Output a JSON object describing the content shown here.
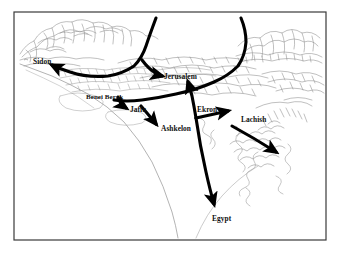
{
  "figure": {
    "type": "pictorial-relief-map",
    "region": "Eastern Mediterranean coast / Levant",
    "background_color": "#ffffff",
    "frame_color": "#3a3a3a",
    "terrain_ink_color": "#8c8c8c",
    "route_color": "#000000",
    "label_color": "#111111"
  },
  "labels": {
    "sidon": "Sidon",
    "benei_berak": "Benei Berak",
    "jaffa": "Jaffa",
    "jerusalem": "Jerusalem",
    "ashkelon": "Ashkelon",
    "ekron": "Ekron",
    "lachish": "Lachish",
    "egypt": "Egypt"
  },
  "map_data": {
    "places": [
      {
        "name": "Sidon",
        "x": 48,
        "y": 62,
        "label_anchor": "start"
      },
      {
        "name": "Benei Berak",
        "x": 89,
        "y": 97,
        "label_anchor": "start"
      },
      {
        "name": "Jaffa",
        "x": 133,
        "y": 110,
        "label_anchor": "start"
      },
      {
        "name": "Jerusalem",
        "x": 164,
        "y": 78,
        "label_anchor": "start"
      },
      {
        "name": "Ashkelon",
        "x": 163,
        "y": 129,
        "label_anchor": "start"
      },
      {
        "name": "Ekron",
        "x": 199,
        "y": 110,
        "label_anchor": "start"
      },
      {
        "name": "Lachish",
        "x": 243,
        "y": 120,
        "label_anchor": "start"
      },
      {
        "name": "Egypt",
        "x": 215,
        "y": 219,
        "label_anchor": "start"
      }
    ],
    "routes": [
      {
        "id": "route-to-sidon",
        "from": "coastal-trunk",
        "to": "Sidon",
        "style": "thick-arrow"
      },
      {
        "id": "route-to-jerusalem",
        "from": "northern-trunk",
        "to": "Jerusalem",
        "style": "thick-arrow"
      },
      {
        "id": "route-to-jaffa",
        "from": "coastal-trunk",
        "to": "Jaffa",
        "style": "thick-arrow"
      },
      {
        "id": "route-to-ashkelon",
        "from": "Jaffa",
        "to": "Ashkelon",
        "style": "thick-arrow"
      },
      {
        "id": "route-to-ekron",
        "from": "coastal-trunk",
        "to": "Ekron",
        "style": "thick-arrow"
      },
      {
        "id": "route-to-lachish",
        "from": "Ekron",
        "to": "Lachish",
        "style": "thick-arrow"
      },
      {
        "id": "route-to-southeast",
        "from": "Lachish",
        "to": "southeast-hills",
        "style": "thick-arrow"
      },
      {
        "id": "route-to-egypt",
        "from": "coastal-trunk",
        "to": "Egypt",
        "style": "thick-arrow"
      }
    ]
  }
}
